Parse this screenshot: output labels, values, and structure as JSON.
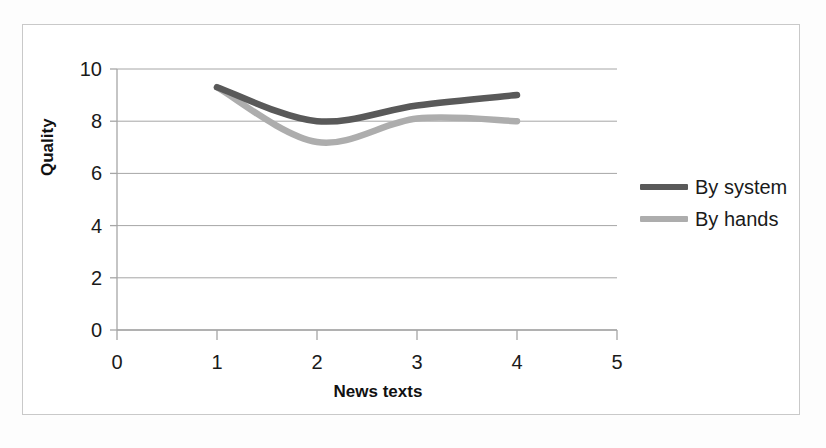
{
  "chart_data": {
    "type": "line",
    "title": "",
    "subtitle": "",
    "xlabel": "News texts",
    "ylabel": "Quality",
    "xlim": [
      0,
      5
    ],
    "ylim": [
      0,
      10
    ],
    "xticks": [
      "0",
      "1",
      "2",
      "3",
      "4",
      "5"
    ],
    "yticks": [
      "0",
      "2",
      "4",
      "6",
      "8",
      "10"
    ],
    "grid": "horizontal",
    "legend_position": "right",
    "x": [
      1,
      2,
      3,
      4
    ],
    "series": [
      {
        "name": "By system",
        "color": "#595959",
        "values": [
          9.3,
          8.0,
          8.6,
          9.0
        ]
      },
      {
        "name": "By hands",
        "color": "#adadad",
        "values": [
          9.3,
          7.2,
          8.1,
          8.0
        ]
      }
    ]
  },
  "axes": {
    "y_title": "Quality",
    "x_title": "News texts",
    "y_tick_labels": [
      "10",
      "8",
      "6",
      "4",
      "2",
      "0"
    ],
    "x_tick_labels": [
      "0",
      "1",
      "2",
      "3",
      "4",
      "5"
    ]
  },
  "legend": {
    "items": [
      {
        "label": "By system",
        "color": "#595959"
      },
      {
        "label": "By hands",
        "color": "#adadad"
      }
    ]
  },
  "colors": {
    "series_system": "#595959",
    "series_hands": "#adadad",
    "grid": "#a6a6a6",
    "axis": "#a6a6a6",
    "frame": "#c9c9c9",
    "text": "#1a1a1a"
  }
}
